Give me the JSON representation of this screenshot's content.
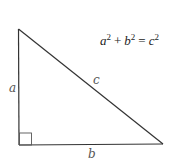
{
  "diagram": {
    "equation": {
      "a": "a",
      "a_exp": "2",
      "plus": "+",
      "b": "b",
      "b_exp": "2",
      "equals": "=",
      "c": "c",
      "c_exp": "2"
    },
    "labels": {
      "side_a": "a",
      "side_b": "b",
      "side_c": "c"
    },
    "vertices": {
      "top": [
        18,
        29
      ],
      "right_angle": [
        19,
        145
      ],
      "right": [
        163,
        144
      ]
    },
    "colors": {
      "line": "#333333",
      "label": "#555555",
      "background": "#ffffff"
    }
  }
}
